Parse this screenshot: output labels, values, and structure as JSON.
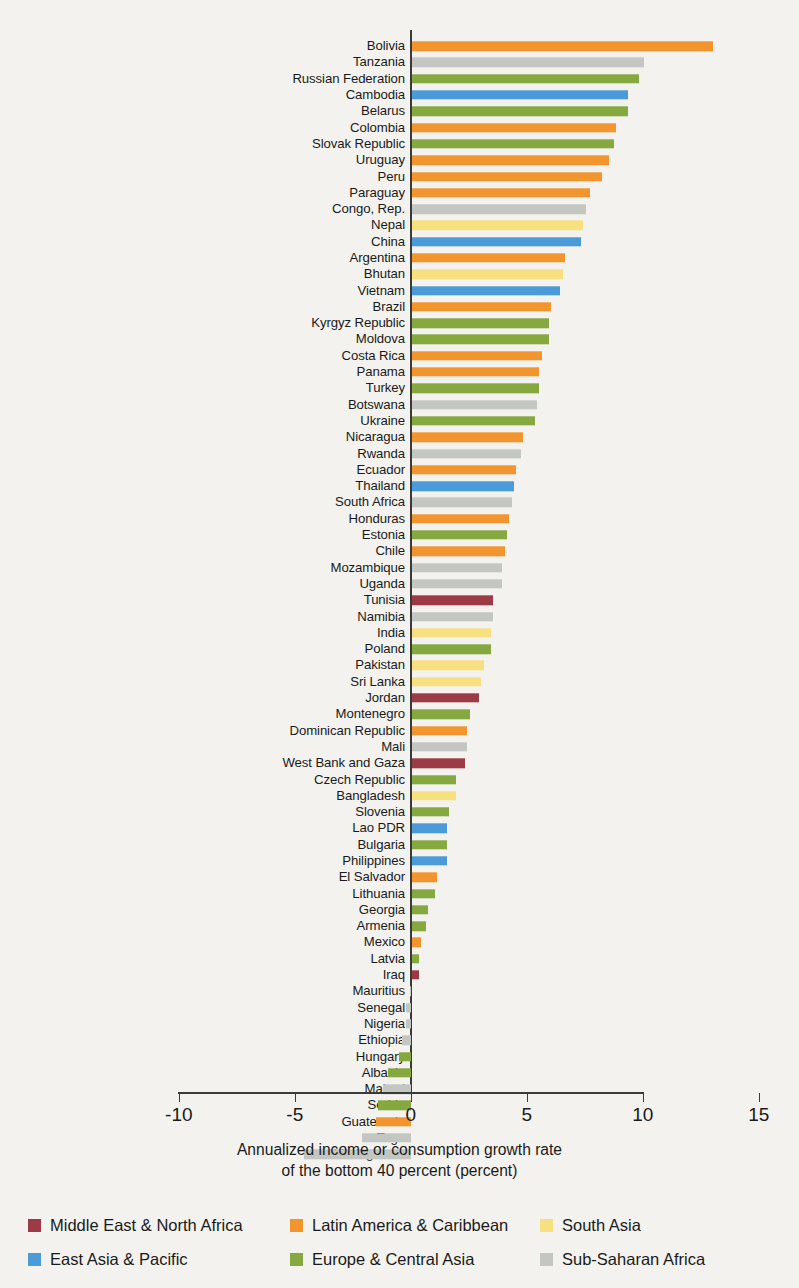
{
  "axis": {
    "title_line1": "Annualized income or consumption growth rate",
    "title_line2": "of the bottom 40 percent (percent)",
    "ticks": [
      "-10",
      "-5",
      "0",
      "5",
      "10",
      "15"
    ]
  },
  "legend": {
    "items": [
      {
        "label": "Middle East & North Africa",
        "color": "#9c3b45",
        "key": "mena"
      },
      {
        "label": "Latin America & Caribbean",
        "color": "#f3952f",
        "key": "lac"
      },
      {
        "label": "South Asia",
        "color": "#f7e07f",
        "key": "sa"
      },
      {
        "label": "East Asia & Pacific",
        "color": "#4a9bd8",
        "key": "eap"
      },
      {
        "label": "Europe & Central Asia",
        "color": "#85a93f",
        "key": "eca"
      },
      {
        "label": "Sub-Saharan Africa",
        "color": "#c4c6c2",
        "key": "ssa"
      }
    ]
  },
  "chart_data": {
    "type": "bar",
    "orientation": "horizontal",
    "title": "",
    "xlabel": "Annualized income or consumption growth rate of the bottom 40 percent (percent)",
    "ylabel": "",
    "xlim": [
      -11.5,
      16.5
    ],
    "xticks": [
      -10,
      -5,
      0,
      5,
      10,
      15
    ],
    "grid": false,
    "legend_position": "bottom",
    "group_colors": {
      "mena": "#9c3b45",
      "lac": "#f3952f",
      "sa": "#f7e07f",
      "eap": "#4a9bd8",
      "eca": "#85a93f",
      "ssa": "#c4c6c2"
    },
    "categories": [
      "Bolivia",
      "Tanzania",
      "Russian Federation",
      "Cambodia",
      "Belarus",
      "Colombia",
      "Slovak Republic",
      "Uruguay",
      "Peru",
      "Paraguay",
      "Congo, Rep.",
      "Nepal",
      "China",
      "Argentina",
      "Bhutan",
      "Vietnam",
      "Brazil",
      "Kyrgyz Republic",
      "Moldova",
      "Costa Rica",
      "Panama",
      "Turkey",
      "Botswana",
      "Ukraine",
      "Nicaragua",
      "Rwanda",
      "Ecuador",
      "Thailand",
      "South Africa",
      "Honduras",
      "Estonia",
      "Chile",
      "Mozambique",
      "Uganda",
      "Tunisia",
      "Namibia",
      "India",
      "Poland",
      "Pakistan",
      "Sri Lanka",
      "Jordan",
      "Montenegro",
      "Dominican Republic",
      "Mali",
      "West Bank and Gaza",
      "Czech Republic",
      "Bangladesh",
      "Slovenia",
      "Lao PDR",
      "Bulgaria",
      "Philippines",
      "El Salvador",
      "Lithuania",
      "Georgia",
      "Armenia",
      "Mexico",
      "Latvia",
      "Iraq",
      "Mauritius",
      "Senegal",
      "Nigeria",
      "Ethiopia",
      "Hungary",
      "Albania",
      "Malawi",
      "Serbia",
      "Guatemala",
      "Togo",
      "Madagascar"
    ],
    "values": [
      13.0,
      10.0,
      9.8,
      9.3,
      9.3,
      8.8,
      8.7,
      8.5,
      8.2,
      7.7,
      7.5,
      7.4,
      7.3,
      6.6,
      6.5,
      6.4,
      6.0,
      5.9,
      5.9,
      5.6,
      5.5,
      5.5,
      5.4,
      5.3,
      4.8,
      4.7,
      4.5,
      4.4,
      4.3,
      4.2,
      4.1,
      4.0,
      3.9,
      3.9,
      3.5,
      3.5,
      3.4,
      3.4,
      3.1,
      3.0,
      2.9,
      2.5,
      2.4,
      2.4,
      2.3,
      1.9,
      1.9,
      1.6,
      1.5,
      1.5,
      1.5,
      1.1,
      1.0,
      0.7,
      0.6,
      0.4,
      0.3,
      0.3,
      -0.05,
      -0.2,
      -0.2,
      -0.4,
      -0.5,
      -1.0,
      -1.2,
      -1.4,
      -1.5,
      -2.1,
      -4.6
    ],
    "groups": [
      "lac",
      "ssa",
      "eca",
      "eap",
      "eca",
      "lac",
      "eca",
      "lac",
      "lac",
      "lac",
      "ssa",
      "sa",
      "eap",
      "lac",
      "sa",
      "eap",
      "lac",
      "eca",
      "eca",
      "lac",
      "lac",
      "eca",
      "ssa",
      "eca",
      "lac",
      "ssa",
      "lac",
      "eap",
      "ssa",
      "lac",
      "eca",
      "lac",
      "ssa",
      "ssa",
      "mena",
      "ssa",
      "sa",
      "eca",
      "sa",
      "sa",
      "mena",
      "eca",
      "lac",
      "ssa",
      "mena",
      "eca",
      "sa",
      "eca",
      "eap",
      "eca",
      "eap",
      "lac",
      "eca",
      "eca",
      "eca",
      "lac",
      "eca",
      "mena",
      "ssa",
      "ssa",
      "ssa",
      "ssa",
      "eca",
      "eca",
      "ssa",
      "eca",
      "lac",
      "ssa",
      "ssa"
    ]
  }
}
